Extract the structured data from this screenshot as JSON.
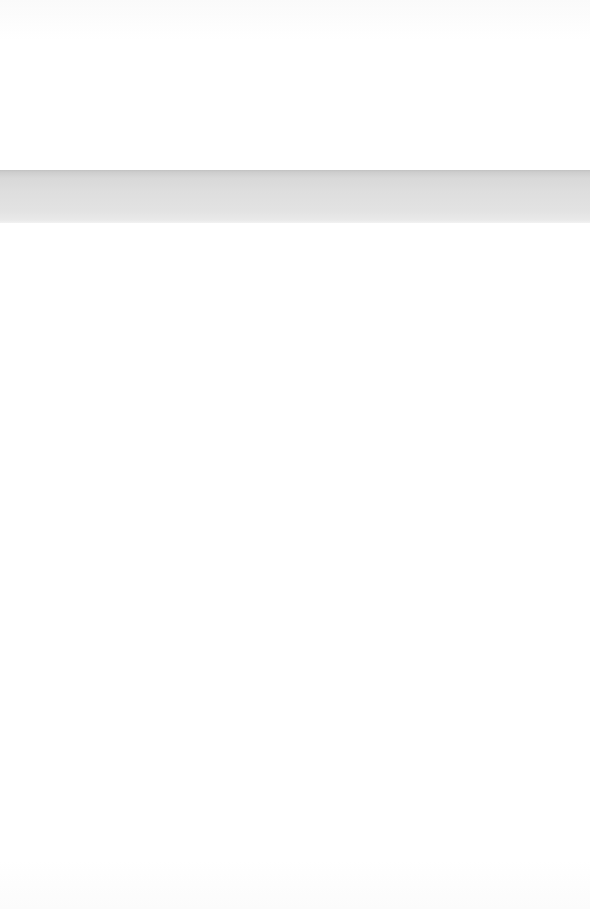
{
  "page": {
    "width": 590,
    "height": 909,
    "background_color": "#fefefe"
  },
  "paragraph_top": {
    "lines": [
      " ",
      " ",
      " ",
      " "
    ]
  },
  "band": {
    "label": "",
    "background_top_color": "#c2c2c2",
    "background_bottom_color": "#f2f2f2",
    "lines": [
      " ",
      " "
    ]
  },
  "paragraph_bottom": {
    "lines": [
      " ",
      " "
    ]
  },
  "blank_area": {
    "label": ""
  }
}
